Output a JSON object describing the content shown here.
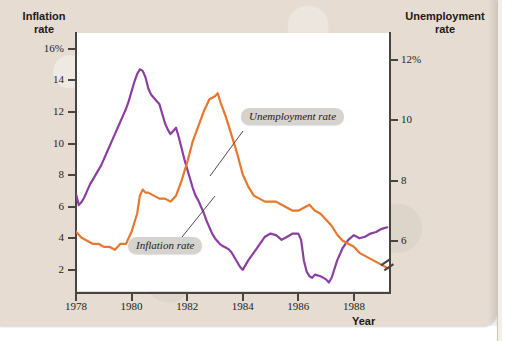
{
  "figure": {
    "left_axis_title": "Inflation\nrate",
    "left_axis_title_line1": "Inflation",
    "left_axis_title_line2": "rate",
    "right_axis_title_line1": "Unemployment",
    "right_axis_title_line2": "rate",
    "x_axis_title": "Year",
    "callout_inflation": "Inflation rate",
    "callout_unemployment": "Unemployment rate"
  },
  "colors": {
    "inflation": "#8b3fa0",
    "unemployment": "#e8762c",
    "axis": "#4a4440",
    "paper": "#e6dcd2",
    "plot_background": "#ffffff",
    "callout_background": "#d6d2cd",
    "text": "#1c1917"
  },
  "axis_labels": {
    "left": [
      "16%",
      "14",
      "12",
      "10",
      "8",
      "6",
      "4",
      "2"
    ],
    "right": [
      "12%",
      "10",
      "8",
      "6"
    ],
    "x": [
      "1978",
      "1980",
      "1982",
      "1984",
      "1986",
      "1988"
    ]
  },
  "chart_data": {
    "type": "line",
    "title": "",
    "xlabel": "Year",
    "ylabel": "Inflation rate",
    "y2label": "Unemployment rate",
    "grid": false,
    "legend_position": "inline-callouts",
    "xlim": [
      1978,
      1989.3
    ],
    "ylim": [
      0.6,
      17.0
    ],
    "y2lim": [
      4.3,
      12.9
    ],
    "left_axis_ticks": [
      2,
      4,
      6,
      8,
      10,
      12,
      14,
      16
    ],
    "right_axis_ticks": [
      6,
      8,
      10,
      12
    ],
    "x_ticks": [
      1978,
      1980,
      1982,
      1984,
      1986,
      1988
    ],
    "right_axis_break": true,
    "annotations": [
      {
        "text": "Inflation rate",
        "points_to_series": "Inflation rate"
      },
      {
        "text": "Unemployment rate",
        "points_to_series": "Unemployment rate"
      }
    ],
    "series": [
      {
        "name": "Inflation rate",
        "axis": "left",
        "color": "#8b3fa0",
        "x": [
          1978.0,
          1978.1,
          1978.2,
          1978.3,
          1978.4,
          1978.5,
          1978.6,
          1978.7,
          1978.8,
          1978.9,
          1979.0,
          1979.1,
          1979.2,
          1979.3,
          1979.4,
          1979.5,
          1979.6,
          1979.7,
          1979.8,
          1979.9,
          1980.0,
          1980.1,
          1980.2,
          1980.3,
          1980.4,
          1980.5,
          1980.6,
          1980.7,
          1980.8,
          1980.9,
          1981.0,
          1981.1,
          1981.2,
          1981.3,
          1981.4,
          1981.5,
          1981.6,
          1981.7,
          1981.8,
          1981.9,
          1982.0,
          1982.1,
          1982.2,
          1982.3,
          1982.4,
          1982.5,
          1982.6,
          1982.7,
          1982.8,
          1982.9,
          1983.0,
          1983.1,
          1983.2,
          1983.3,
          1983.4,
          1983.5,
          1983.6,
          1983.7,
          1983.8,
          1983.9,
          1984.0,
          1984.2,
          1984.4,
          1984.6,
          1984.8,
          1985.0,
          1985.2,
          1985.4,
          1985.6,
          1985.8,
          1986.0,
          1986.1,
          1986.2,
          1986.3,
          1986.4,
          1986.5,
          1986.6,
          1986.8,
          1987.0,
          1987.1,
          1987.2,
          1987.4,
          1987.6,
          1987.8,
          1988.0,
          1988.2,
          1988.4,
          1988.6,
          1988.8,
          1989.0,
          1989.2
        ],
        "y": [
          6.8,
          6.1,
          6.3,
          6.6,
          7.0,
          7.4,
          7.7,
          8.0,
          8.3,
          8.6,
          9.0,
          9.4,
          9.8,
          10.2,
          10.6,
          11.0,
          11.4,
          11.8,
          12.2,
          12.7,
          13.3,
          13.9,
          14.4,
          14.7,
          14.6,
          14.2,
          13.5,
          13.1,
          12.9,
          12.7,
          12.5,
          11.9,
          11.3,
          10.9,
          10.6,
          10.8,
          11.0,
          10.4,
          9.7,
          9.0,
          8.4,
          7.8,
          7.2,
          6.7,
          6.4,
          6.0,
          5.6,
          5.1,
          4.7,
          4.3,
          4.0,
          3.8,
          3.6,
          3.5,
          3.4,
          3.3,
          3.1,
          2.8,
          2.5,
          2.2,
          2.0,
          2.6,
          3.1,
          3.6,
          4.1,
          4.3,
          4.2,
          3.9,
          4.1,
          4.3,
          4.3,
          3.9,
          2.6,
          1.9,
          1.6,
          1.5,
          1.7,
          1.6,
          1.4,
          1.2,
          1.5,
          2.6,
          3.4,
          3.9,
          4.2,
          4.0,
          4.1,
          4.3,
          4.4,
          4.6,
          4.7
        ]
      },
      {
        "name": "Unemployment rate",
        "axis": "right",
        "color": "#e8762c",
        "x": [
          1978.0,
          1978.2,
          1978.4,
          1978.6,
          1978.8,
          1979.0,
          1979.2,
          1979.4,
          1979.6,
          1979.8,
          1980.0,
          1980.2,
          1980.3,
          1980.4,
          1980.5,
          1980.6,
          1980.8,
          1981.0,
          1981.2,
          1981.4,
          1981.6,
          1981.8,
          1982.0,
          1982.2,
          1982.4,
          1982.6,
          1982.8,
          1983.0,
          1983.1,
          1983.2,
          1983.4,
          1983.6,
          1983.8,
          1984.0,
          1984.2,
          1984.4,
          1984.6,
          1984.8,
          1985.0,
          1985.2,
          1985.4,
          1985.6,
          1985.8,
          1986.0,
          1986.2,
          1986.4,
          1986.6,
          1986.8,
          1987.0,
          1987.2,
          1987.4,
          1987.6,
          1987.8,
          1988.0,
          1988.2,
          1988.4,
          1988.6,
          1988.8,
          1989.0,
          1989.2
        ],
        "y": [
          6.3,
          6.1,
          6.0,
          5.9,
          5.9,
          5.8,
          5.8,
          5.7,
          5.9,
          5.9,
          6.3,
          6.9,
          7.5,
          7.7,
          7.6,
          7.6,
          7.5,
          7.4,
          7.4,
          7.3,
          7.5,
          8.0,
          8.6,
          9.3,
          9.8,
          10.3,
          10.7,
          10.8,
          10.9,
          10.6,
          10.1,
          9.5,
          8.9,
          8.2,
          7.8,
          7.5,
          7.4,
          7.3,
          7.3,
          7.3,
          7.2,
          7.1,
          7.0,
          7.0,
          7.1,
          7.2,
          7.0,
          6.9,
          6.7,
          6.5,
          6.2,
          6.0,
          5.9,
          5.8,
          5.6,
          5.5,
          5.4,
          5.3,
          5.2,
          5.1
        ]
      }
    ]
  }
}
